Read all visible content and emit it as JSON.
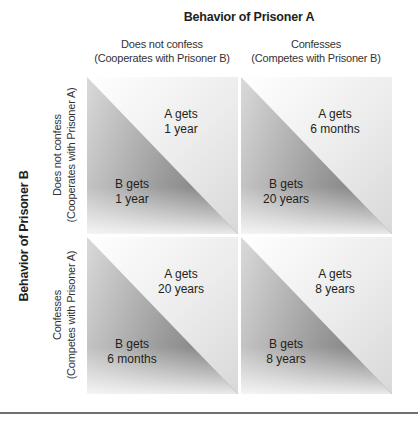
{
  "prisoner_a": {
    "title": "Behavior of Prisoner A",
    "columns": [
      {
        "line1": "Does not confess",
        "line2": "(Cooperates with Prisoner B)"
      },
      {
        "line1": "Confesses",
        "line2": "(Competes with Prisoner B)"
      }
    ]
  },
  "prisoner_b": {
    "title": "Behavior of Prisoner B",
    "rows": [
      {
        "line1": "Does not confess",
        "line2": "(Cooperates with Prisoner A)"
      },
      {
        "line1": "Confesses",
        "line2": "(Competes with Prisoner A)"
      }
    ]
  },
  "matrix": [
    [
      {
        "a_line1": "A gets",
        "a_line2": "1 year",
        "b_line1": "B gets",
        "b_line2": "1 year"
      },
      {
        "a_line1": "A gets",
        "a_line2": "6 months",
        "b_line1": "B gets",
        "b_line2": "20 years"
      }
    ],
    [
      {
        "a_line1": "A gets",
        "a_line2": "20 years",
        "b_line1": "B gets",
        "b_line2": "6 months"
      },
      {
        "a_line1": "A gets",
        "a_line2": "8 years",
        "b_line1": "B gets",
        "b_line2": "8 years"
      }
    ]
  ]
}
